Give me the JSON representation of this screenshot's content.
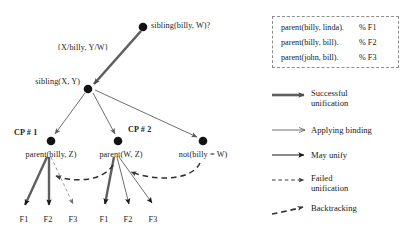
{
  "diagram": {
    "nodes": [
      {
        "id": "root",
        "label": "sibling(billy, W)?",
        "x": 143,
        "y": 27,
        "label_x": 151,
        "label_y": 22,
        "align": "left"
      },
      {
        "id": "sib",
        "label": "sibling(X, Y)",
        "x": 88,
        "y": 89,
        "label_x": 80,
        "label_y": 78,
        "align": "right"
      },
      {
        "id": "cp1",
        "label": "parent(billy, Z)",
        "x": 51,
        "y": 141,
        "label_x": 51,
        "label_y": 149,
        "align": "center"
      },
      {
        "id": "cp2",
        "label": "parent(W, Z)",
        "x": 118,
        "y": 141,
        "label_x": 120,
        "label_y": 149,
        "align": "center"
      },
      {
        "id": "notnode",
        "label": "not(billy = W)",
        "x": 203,
        "y": 141,
        "label_x": 203,
        "label_y": 149,
        "align": "center"
      }
    ],
    "binding_label": {
      "text": "{X/billy, Y/W}",
      "x": 57,
      "y": 44
    },
    "cp_labels": [
      {
        "text": "CP # 1",
        "x": 14,
        "y": 129
      },
      {
        "text": "CP # 2",
        "x": 128,
        "y": 126
      }
    ],
    "fact_leaves_left": [
      {
        "text": "F1",
        "x": 22,
        "y": 220
      },
      {
        "text": "F2",
        "x": 46,
        "y": 220
      },
      {
        "text": "F3",
        "x": 70,
        "y": 220
      }
    ],
    "fact_leaves_right": [
      {
        "text": "F1",
        "x": 103,
        "y": 220
      },
      {
        "text": "F2",
        "x": 127,
        "y": 220
      },
      {
        "text": "F3",
        "x": 152,
        "y": 220
      }
    ],
    "colors": {
      "ink": "#1a1a1a",
      "thick_edge": "#5a5a5a",
      "thin_edge": "#6b6b6b",
      "dashed": "#4a4a4a",
      "node_fill": "#141414",
      "box_border": "#8d8d8d"
    }
  },
  "facts_box": {
    "rows": [
      {
        "fact": "parent(billy, linda).",
        "comment": "% F1"
      },
      {
        "fact": "parent(billy, bill).",
        "comment": "% F2"
      },
      {
        "fact": "parent(john, bill).",
        "comment": "% F3"
      }
    ]
  },
  "legend": {
    "items": [
      {
        "key": "successful-unification",
        "line1": "Successful",
        "line2": "unification"
      },
      {
        "key": "applying-binding",
        "line1": "Applying binding",
        "line2": ""
      },
      {
        "key": "may-unify",
        "line1": "May unify",
        "line2": ""
      },
      {
        "key": "failed-unification",
        "line1": "Failed",
        "line2": "unification"
      },
      {
        "key": "backtracking",
        "line1": "Backtracking",
        "line2": ""
      }
    ]
  }
}
